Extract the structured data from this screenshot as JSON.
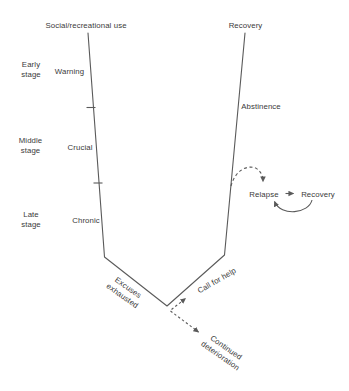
{
  "colors": {
    "background": "#ffffff",
    "line": "#5a5a5a",
    "text": "#3a3a3a"
  },
  "diagram": {
    "top_left": "Social/recreational use",
    "top_right": "Recovery",
    "stages": [
      {
        "stage": "Early\nstage",
        "phase": "Warning"
      },
      {
        "stage": "Middle\nstage",
        "phase": "Crucial"
      },
      {
        "stage": "Late\nstage",
        "phase": "Chronic"
      }
    ],
    "right_side": {
      "abstinence": "Abstinence"
    },
    "relapse_cycle": {
      "relapse": "Relapse",
      "recovery": "Recovery"
    },
    "bottom": {
      "excuses": "Excuses\nexhausted",
      "call_for_help": "Call for help",
      "continued": "Continued\ndeterioration"
    }
  }
}
